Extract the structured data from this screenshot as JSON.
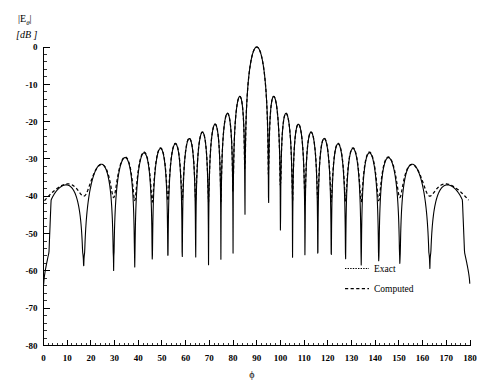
{
  "chart_data": {
    "type": "line",
    "title": "",
    "subtitle": "",
    "xlabel": "ϕ",
    "ylabel_main": "|E",
    "ylabel_sub": "θ",
    "ylabel_close": "|",
    "ylabel_units": "[dB ]",
    "xlim": [
      0,
      180
    ],
    "ylim": [
      -80,
      0
    ],
    "xticks": [
      0,
      10,
      20,
      30,
      40,
      50,
      60,
      70,
      80,
      90,
      100,
      110,
      120,
      130,
      140,
      150,
      160,
      170,
      180
    ],
    "yticks": [
      0,
      -10,
      -20,
      -30,
      -40,
      -50,
      -60,
      -70,
      -80
    ],
    "xtick_labels": [
      "0",
      "10",
      "20",
      "30",
      "40",
      "50",
      "60",
      "70",
      "80",
      "90",
      "100",
      "110",
      "120",
      "130",
      "140",
      "150",
      "160",
      "170",
      "180"
    ],
    "ytick_labels": [
      "0",
      "-10",
      "-20",
      "-30",
      "-40",
      "-50",
      "-60",
      "-70",
      "-80"
    ],
    "x_minor_interval": 2,
    "y_minor_interval": 2,
    "grid": false,
    "legend_position": "lower right",
    "legend": [
      {
        "name": "Exact",
        "style": "dotted"
      },
      {
        "name": "Computed",
        "style": "dashed"
      }
    ],
    "series": [
      {
        "name": "Exact",
        "style": "solid",
        "color": "#000000",
        "comment": "Array-factor style pattern: main lobe peak 0 dB at phi=90, deep nulls to about -55 dB, sidelobe envelope falling from about -13 dB near main lobe to about -27 dB at the wings, steep rolloff to -75 dB at phi=0 and phi=180",
        "main_lobe_peak_db": 0,
        "main_lobe_center_deg": 90,
        "null_floor_db": -55,
        "edge_value_db": -75,
        "sidelobe_peaks_db": [
          -26.5,
          -25.5,
          -25.0,
          -24.0,
          -23.0,
          -22.0,
          -21.0,
          -19.5,
          -18.0,
          -16.0,
          -13.5,
          -13.5,
          -16.0,
          -18.0,
          -19.5,
          -21.0,
          -22.0,
          -23.0,
          -24.0,
          -25.0,
          -25.5,
          -26.5
        ]
      },
      {
        "name": "Computed",
        "style": "dashed",
        "color": "#000000",
        "comment": "Follows Exact closely over the central region; diverges near the wings where nulls fill in around -37 dB and the edges flatten near -39 dB instead of rolling off",
        "edge_value_db": -39,
        "null_fill_db": -37
      }
    ]
  },
  "axes": {
    "y_axis_name": "magnitude-axis",
    "x_axis_name": "angle-axis"
  }
}
